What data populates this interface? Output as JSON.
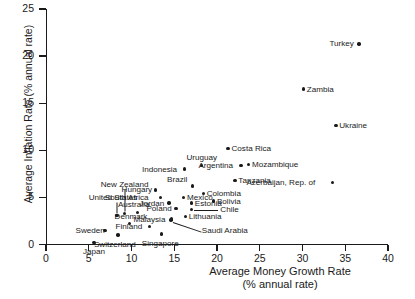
{
  "chart_data": {
    "type": "scatter",
    "title": "",
    "xlabel": "Average Money Growth Rate (% annual rate)",
    "xlabel_line1": "Average Money Growth Rate",
    "xlabel_line2": "(% annual rate)",
    "ylabel": "Average Inflation Rate (% annual rate)",
    "xlim": [
      0,
      40
    ],
    "ylim": [
      0,
      25
    ],
    "xticks": [
      0,
      5,
      10,
      15,
      20,
      25,
      30,
      35,
      40
    ],
    "yticks": [
      0,
      5,
      10,
      15,
      20,
      25
    ],
    "xtick_labels": [
      "0",
      "5",
      "10",
      "15",
      "20",
      "25",
      "30",
      "35",
      "40"
    ],
    "ytick_labels": [
      "0",
      "5",
      "10",
      "15",
      "20",
      "25"
    ],
    "grid": false,
    "legend": "none",
    "marker_color": "#1a1a1a",
    "points": [
      {
        "label": "Turkey",
        "x": 36.6,
        "y": 21.3,
        "label_pos": "left"
      },
      {
        "label": "Zambia",
        "x": 30.1,
        "y": 16.5,
        "label_pos": "right"
      },
      {
        "label": "Ukraine",
        "x": 33.9,
        "y": 12.6,
        "label_pos": "right"
      },
      {
        "label": "Costa Rica",
        "x": 21.3,
        "y": 10.2,
        "label_pos": "right"
      },
      {
        "label": "Mozambique",
        "x": 23.7,
        "y": 8.5,
        "label_pos": "right"
      },
      {
        "label": "Argentina",
        "x": 22.8,
        "y": 8.4,
        "label_pos": "left"
      },
      {
        "label": "Uruguay",
        "x": 18.2,
        "y": 8.4,
        "label_pos": "above"
      },
      {
        "label": "Indonesia",
        "x": 16.2,
        "y": 8.0,
        "label_pos": "left"
      },
      {
        "label": "Tanzania",
        "x": 22.1,
        "y": 6.8,
        "label_pos": "right"
      },
      {
        "label": "Azerbaijan, Rep. of",
        "x": 33.5,
        "y": 6.6,
        "label_pos": "left"
      },
      {
        "label": "Brazil",
        "x": 17.1,
        "y": 6.2,
        "label_pos": "above-left"
      },
      {
        "label": "Hungary",
        "x": 12.8,
        "y": 5.8,
        "label_pos": "left"
      },
      {
        "label": "Colombia",
        "x": 18.4,
        "y": 5.4,
        "label_pos": "right"
      },
      {
        "label": "Mexico",
        "x": 16.1,
        "y": 5.0,
        "label_pos": "right"
      },
      {
        "label": "South Africa",
        "x": 13.4,
        "y": 5.0,
        "label_pos": "left"
      },
      {
        "label": "Bolivia",
        "x": 19.6,
        "y": 4.6,
        "label_pos": "right"
      },
      {
        "label": "Estonia",
        "x": 17.0,
        "y": 4.4,
        "label_pos": "right"
      },
      {
        "label": "Jordan",
        "x": 14.4,
        "y": 4.4,
        "label_pos": "left"
      },
      {
        "label": "Poland",
        "x": 15.2,
        "y": 3.8,
        "label_pos": "left"
      },
      {
        "label": "Chile",
        "x": 17.0,
        "y": 3.7,
        "label_pos": "leader-right"
      },
      {
        "label": "New Zealand",
        "x": 9.2,
        "y": 3.3,
        "label_pos": "leader-up"
      },
      {
        "label": "Australia",
        "x": 10.7,
        "y": 3.4,
        "label_pos": "above"
      },
      {
        "label": "Lithuania",
        "x": 16.3,
        "y": 3.0,
        "label_pos": "right"
      },
      {
        "label": "United States",
        "x": 8.3,
        "y": 3.1,
        "label_pos": "leader-up"
      },
      {
        "label": "Malaysia",
        "x": 14.7,
        "y": 2.7,
        "label_pos": "left"
      },
      {
        "label": "Saudi Arabia",
        "x": 14.6,
        "y": 2.6,
        "label_pos": "leader-down-right"
      },
      {
        "label": "Denmark",
        "x": 9.8,
        "y": 2.2,
        "label_pos": "above"
      },
      {
        "label": "Finland",
        "x": 12.1,
        "y": 1.9,
        "label_pos": "left"
      },
      {
        "label": "Sweden",
        "x": 6.9,
        "y": 1.5,
        "label_pos": "left"
      },
      {
        "label": "Singapore",
        "x": 13.5,
        "y": 1.1,
        "label_pos": "below"
      },
      {
        "label": "Switzerland",
        "x": 8.4,
        "y": 1.0,
        "label_pos": "below"
      },
      {
        "label": "Japan",
        "x": 5.6,
        "y": 0.2,
        "label_pos": "below"
      }
    ]
  }
}
